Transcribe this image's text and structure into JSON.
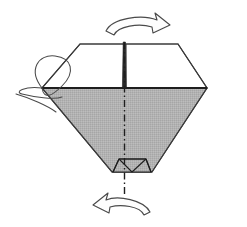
{
  "figure": {
    "title": "Origami folding step diagram",
    "background_color": "#ffffff"
  },
  "colors": {
    "paper_white": "#ffffff",
    "paper_shaded": "#b2b2b2",
    "outline": "#3a3a3a",
    "outline_heavy": "#222222",
    "arrow_stroke": "#4a4a4a",
    "arrow_fill": "#fdfdfd",
    "fold_line": "#1e1e1e"
  },
  "shapes": {
    "hexagon_body": {
      "name": "paper-outline",
      "points": "80,44 178,44 207,88 152,172 112,172 42,88"
    },
    "upper_panel_left": {
      "name": "upper-left-panel",
      "points": "80,44 124,44 124,88 42,88"
    },
    "upper_panel_right": {
      "name": "upper-right-panel",
      "points": "126,44 178,44 207,88 126,88"
    },
    "lower_shaded_v": {
      "name": "lower-shaded-panel",
      "points": "42,88 207,88 152,172 112,172"
    },
    "waist_line": {
      "name": "horizontal-crease",
      "x1": 42,
      "y1": 88,
      "x2": 207,
      "y2": 88
    },
    "center_slit": {
      "name": "center-slit",
      "points": "123.2,42 125.4,42 126.2,88 122.4,88"
    },
    "bottom_trapezoid": {
      "name": "bottom-flap",
      "points": "113,172 151,172 146,159 119,159"
    },
    "bottom_creases": [
      {
        "name": "flap-crease-left",
        "x1": 113,
        "y1": 172,
        "x2": 119,
        "y2": 159
      },
      {
        "name": "flap-crease-left-inner",
        "x1": 132,
        "y1": 172,
        "x2": 119,
        "y2": 159
      },
      {
        "name": "flap-crease-right-inner",
        "x1": 132,
        "y1": 172,
        "x2": 146,
        "y2": 159
      },
      {
        "name": "flap-crease-right",
        "x1": 151,
        "y1": 172,
        "x2": 146,
        "y2": 159
      },
      {
        "name": "flap-crease-top",
        "x1": 119,
        "y1": 159,
        "x2": 146,
        "y2": 159
      }
    ]
  },
  "fold_line": {
    "name": "center-fold-dash-dot-line",
    "x": 124.5,
    "y_top": 42,
    "y_bottom": 195,
    "style": "dash-dot",
    "dasharray": "7 3 1.5 3"
  },
  "arrows": {
    "top": {
      "name": "rotate-arrow-top",
      "direction": "right",
      "path": "M 106,31 C 112,18 142,14 157,20 L 155,13 L 170,25 L 153,33 L 152,27 C 139,23 118,26 114,35 Z"
    },
    "bottom": {
      "name": "rotate-arrow-bottom",
      "direction": "left",
      "path": "M 150,212 C 144,200 118,195 106,200 L 108,193 L 93,205 L 109,213 L 110,207 C 121,204 140,206 144,215 Z"
    },
    "left_loop": {
      "name": "flap-rotation-loop",
      "outer_path": "M 42,88 C 28,70 38,54 55,56 C 72,58 76,72 62,86 C 52,96 44,100 42,88 Z",
      "inner_path": "M 42,88 C 24,86 14,92 22,94 C 34,97 54,100 62,97",
      "tail_path": "M 16,94 C 30,98 48,106 56,112"
    }
  },
  "annotations": {
    "step_label": "",
    "notes": ""
  }
}
